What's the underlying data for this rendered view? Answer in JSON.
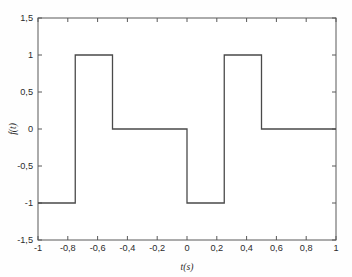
{
  "chart_data": {
    "type": "line",
    "title": "",
    "subtitle": "",
    "xlabel": "t(s)",
    "ylabel": "f(t)",
    "xlim": [
      -1,
      1
    ],
    "ylim": [
      -1.5,
      1.5
    ],
    "grid": false,
    "legend": null,
    "style": "step",
    "line_color": "#4a4a4a",
    "axis_color": "#595959",
    "background_color": "#fefefe",
    "xticks": [
      -1,
      -0.8,
      -0.6,
      -0.4,
      -0.2,
      0,
      0.2,
      0.4,
      0.6,
      0.8,
      1
    ],
    "xticklabels": [
      "-1",
      "-0,8",
      "-0,6",
      "-0,4",
      "-0,2",
      "0",
      "0,2",
      "0,4",
      "0,6",
      "0,8",
      "1"
    ],
    "yticks": [
      -1.5,
      -1,
      -0.5,
      0,
      0.5,
      1,
      1.5
    ],
    "yticklabels": [
      "-1,5",
      "-1",
      "-0,5",
      "0",
      "0,5",
      "1",
      "1,5"
    ],
    "series": [
      {
        "name": "f(t)",
        "x": [
          -1,
          -0.75,
          -0.75,
          -0.5,
          -0.5,
          0,
          0,
          0.25,
          0.25,
          0.5,
          0.5,
          1
        ],
        "values": [
          -1,
          -1,
          1,
          1,
          0,
          0,
          -1,
          -1,
          1,
          1,
          0,
          0
        ]
      }
    ],
    "segments": [
      {
        "t_start": -1,
        "t_end": -0.75,
        "level": -1
      },
      {
        "t_start": -0.75,
        "t_end": -0.5,
        "level": 1
      },
      {
        "t_start": -0.5,
        "t_end": 0,
        "level": 0
      },
      {
        "t_start": 0,
        "t_end": 0.25,
        "level": -1
      },
      {
        "t_start": 0.25,
        "t_end": 0.5,
        "level": 1
      },
      {
        "t_start": 0.5,
        "t_end": 1,
        "level": 0
      }
    ]
  }
}
